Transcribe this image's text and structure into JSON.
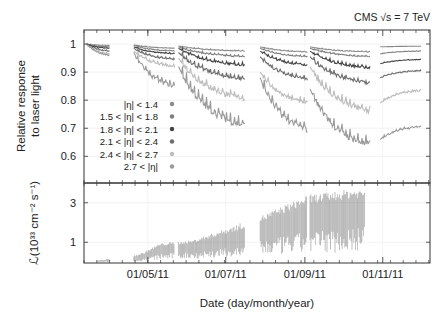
{
  "chart_data": [
    {
      "type": "line",
      "panel": "top",
      "title": "",
      "annotation": "CMS √s = 7 TeV",
      "xlabel": "Date (day/month/year)",
      "ylabel_lines": [
        "Relative response",
        "to laser light"
      ],
      "ylim": [
        0.505,
        1.05
      ],
      "yticks": [
        1,
        0.9,
        0.8,
        0.7,
        0.6
      ],
      "ytick_labels": [
        "1",
        "0.9",
        "0.8",
        "0.7",
        "0.6"
      ],
      "x_unit": "days since 2011-03-12",
      "xlim": [
        0,
        271
      ],
      "grid": true,
      "legend_position": "lower-left",
      "segments_days": [
        [
          2,
          20
        ],
        [
          39,
          71
        ],
        [
          74,
          126
        ],
        [
          138,
          175
        ],
        [
          177,
          224
        ],
        [
          232,
          264
        ]
      ],
      "series": [
        {
          "name": "|η| < 1.4",
          "color": "#8a8a8a",
          "anchors": [
            [
              2,
              1.0
            ],
            [
              20,
              0.995
            ],
            [
              39,
              0.997
            ],
            [
              71,
              0.985
            ],
            [
              74,
              0.993
            ],
            [
              126,
              0.975
            ],
            [
              138,
              0.99
            ],
            [
              175,
              0.972
            ],
            [
              177,
              0.99
            ],
            [
              224,
              0.972
            ],
            [
              232,
              0.99
            ],
            [
              264,
              0.992
            ]
          ]
        },
        {
          "name": "1.5 < |η| < 1.8",
          "color": "#7f7f7f",
          "anchors": [
            [
              2,
              1.0
            ],
            [
              20,
              0.99
            ],
            [
              39,
              0.995
            ],
            [
              71,
              0.975
            ],
            [
              74,
              0.99
            ],
            [
              126,
              0.955
            ],
            [
              138,
              0.985
            ],
            [
              175,
              0.955
            ],
            [
              177,
              0.985
            ],
            [
              224,
              0.955
            ],
            [
              232,
              0.965
            ],
            [
              264,
              0.975
            ]
          ]
        },
        {
          "name": "1.8 < |η| < 2.1",
          "color": "#444444",
          "anchors": [
            [
              2,
              1.0
            ],
            [
              20,
              0.985
            ],
            [
              39,
              0.99
            ],
            [
              71,
              0.965
            ],
            [
              74,
              0.985
            ],
            [
              126,
              0.925
            ],
            [
              138,
              0.975
            ],
            [
              175,
              0.925
            ],
            [
              177,
              0.975
            ],
            [
              224,
              0.915
            ],
            [
              232,
              0.93
            ],
            [
              264,
              0.945
            ]
          ]
        },
        {
          "name": "2.1 < |η| < 2.4",
          "color": "#6e6e6e",
          "anchors": [
            [
              2,
              1.0
            ],
            [
              20,
              0.975
            ],
            [
              39,
              0.985
            ],
            [
              71,
              0.945
            ],
            [
              74,
              0.97
            ],
            [
              126,
              0.875
            ],
            [
              138,
              0.955
            ],
            [
              175,
              0.875
            ],
            [
              177,
              0.955
            ],
            [
              224,
              0.86
            ],
            [
              232,
              0.88
            ],
            [
              264,
              0.905
            ]
          ]
        },
        {
          "name": "2.4 < |η| < 2.7",
          "color": "#bdbdbd",
          "anchors": [
            [
              2,
              1.0
            ],
            [
              20,
              0.965
            ],
            [
              39,
              0.975
            ],
            [
              71,
              0.92
            ],
            [
              74,
              0.95
            ],
            [
              126,
              0.805
            ],
            [
              138,
              0.9
            ],
            [
              175,
              0.79
            ],
            [
              177,
              0.92
            ],
            [
              224,
              0.76
            ],
            [
              232,
              0.79
            ],
            [
              264,
              0.835
            ]
          ]
        },
        {
          "name": "2.7 < |η|",
          "color": "#9a9a9a",
          "anchors": [
            [
              2,
              1.0
            ],
            [
              20,
              0.96
            ],
            [
              39,
              0.97
            ],
            [
              71,
              0.85
            ],
            [
              74,
              0.92
            ],
            [
              126,
              0.71
            ],
            [
              138,
              0.88
            ],
            [
              175,
              0.695
            ],
            [
              177,
              0.84
            ],
            [
              224,
              0.64
            ],
            [
              232,
              0.66
            ],
            [
              264,
              0.705
            ]
          ]
        }
      ]
    },
    {
      "type": "scatter",
      "panel": "bottom",
      "ylabel": "ℒ(10³³ cm⁻² s⁻¹)",
      "ylim": [
        -0.05,
        4.0
      ],
      "yticks": [
        3,
        1
      ],
      "ytick_labels": [
        "3",
        "1"
      ],
      "x_unit": "days since 2011-03-12",
      "xlim": [
        0,
        271
      ],
      "xticks_days": [
        50,
        111,
        173,
        234
      ],
      "xtick_labels": [
        "01/05/11",
        "01/07/11",
        "01/09/11",
        "01/11/11"
      ],
      "color": "#555555",
      "luminosity_envelope": [
        [
          10,
          0.02,
          0.08
        ],
        [
          35,
          0.1,
          0.3
        ],
        [
          45,
          0.2,
          0.45
        ],
        [
          60,
          0.6,
          0.95
        ],
        [
          85,
          0.75,
          1.1
        ],
        [
          120,
          1.1,
          1.9
        ],
        [
          137,
          1.5,
          2.3
        ],
        [
          175,
          2.2,
          3.4
        ],
        [
          210,
          2.5,
          3.7
        ],
        [
          220,
          2.6,
          3.65
        ]
      ]
    }
  ]
}
